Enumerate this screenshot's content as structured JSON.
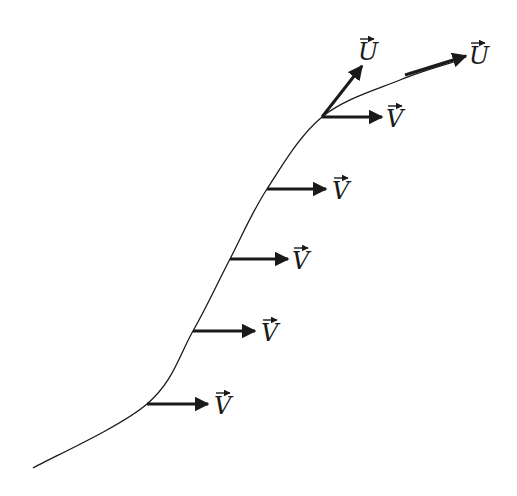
{
  "diagram": {
    "colors": {
      "stroke": "#1a1a1a",
      "background": "#ffffff"
    },
    "curve": {
      "points": [
        [
          33,
          468
        ],
        [
          147,
          404
        ],
        [
          193,
          331
        ],
        [
          230,
          259
        ],
        [
          267,
          189
        ],
        [
          322,
          117
        ],
        [
          400,
          80
        ],
        [
          460,
          60
        ]
      ]
    },
    "v_vectors": [
      {
        "label": "V",
        "x1": 147,
        "y1": 404,
        "x2": 208,
        "y2": 404,
        "lx": 214,
        "ly": 414
      },
      {
        "label": "V",
        "x1": 193,
        "y1": 331,
        "x2": 255,
        "y2": 331,
        "lx": 261,
        "ly": 341
      },
      {
        "label": "V",
        "x1": 230,
        "y1": 259,
        "x2": 288,
        "y2": 259,
        "lx": 292,
        "ly": 269
      },
      {
        "label": "V",
        "x1": 267,
        "y1": 189,
        "x2": 326,
        "y2": 189,
        "lx": 332,
        "ly": 199
      },
      {
        "label": "V",
        "x1": 322,
        "y1": 117,
        "x2": 382,
        "y2": 117,
        "lx": 386,
        "ly": 127
      }
    ],
    "u_vectors": [
      {
        "label": "U",
        "x1": 322,
        "y1": 117,
        "x2": 362,
        "y2": 66,
        "lx": 358,
        "ly": 60
      },
      {
        "label": "U",
        "x1": 405,
        "y1": 75,
        "x2": 466,
        "y2": 56,
        "lx": 469,
        "ly": 64
      }
    ]
  }
}
